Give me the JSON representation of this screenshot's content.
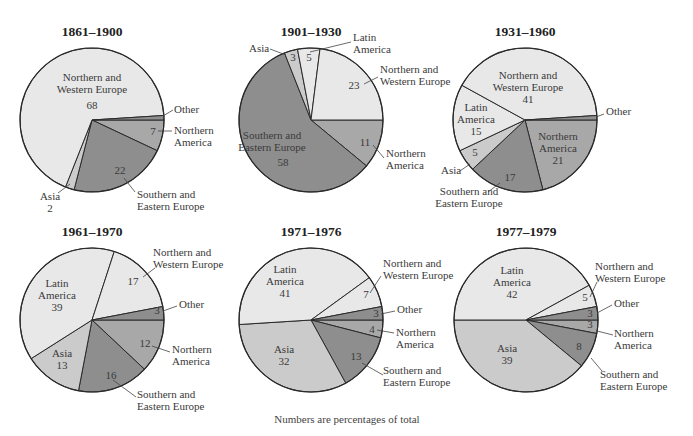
{
  "caption": "Numbers are percentages of total",
  "colors": {
    "Northern and Western Europe": "#e8e8e8",
    "Latin America": "#e8e8e8",
    "Asia": "#cbcbcb",
    "Northern America": "#a8a8a8",
    "Southern and Eastern Europe": "#8e8e8e",
    "Other": "#8e8e8e"
  },
  "chart_data": [
    {
      "type": "pie",
      "title": "1861–1900",
      "center": [
        92,
        120
      ],
      "radius": 72,
      "start_angle_deg": 0,
      "direction": "clockwise",
      "slices": [
        {
          "label": "Northern America",
          "value": 7
        },
        {
          "label": "Southern and Eastern Europe",
          "value": 22
        },
        {
          "label": "Asia",
          "value": 2
        },
        {
          "label": "Northern and Western Europe",
          "value": 68
        },
        {
          "label": "Other",
          "value": 1
        }
      ],
      "annotations": [
        {
          "lines": [
            "Northern and",
            "Western Europe"
          ],
          "x": 92,
          "y": 81,
          "anchor": "middle"
        },
        {
          "lines": [
            "68"
          ],
          "x": 92,
          "y": 109,
          "anchor": "middle"
        },
        {
          "lines": [
            "Other"
          ],
          "x": 174,
          "y": 113,
          "anchor": "start",
          "leader": [
            [
              173,
              110
            ],
            [
              163,
              116
            ]
          ]
        },
        {
          "lines": [
            "Northern",
            "America"
          ],
          "x": 174,
          "y": 134,
          "anchor": "start",
          "leader": [
            [
              172,
              131
            ],
            [
              158,
              131
            ]
          ]
        },
        {
          "lines": [
            "7"
          ],
          "x": 153,
          "y": 135,
          "anchor": "middle"
        },
        {
          "lines": [
            "22"
          ],
          "x": 120,
          "y": 174,
          "anchor": "middle"
        },
        {
          "lines": [
            "Southern and",
            "Eastern Europe"
          ],
          "x": 137,
          "y": 198,
          "anchor": "start",
          "leader": [
            [
              135,
              192
            ],
            [
              124,
              178
            ]
          ]
        },
        {
          "lines": [
            "Asia",
            "2"
          ],
          "x": 50,
          "y": 200,
          "anchor": "middle",
          "leader": [
            [
              58,
              193
            ],
            [
              70,
              184
            ]
          ]
        }
      ]
    },
    {
      "type": "pie",
      "title": "1901–1930",
      "center": [
        311,
        120
      ],
      "radius": 72,
      "start_angle_deg": 0,
      "direction": "clockwise",
      "slices": [
        {
          "label": "Northern America",
          "value": 11
        },
        {
          "label": "Southern and Eastern Europe",
          "value": 58
        },
        {
          "label": "Asia",
          "value": 3
        },
        {
          "label": "Latin America",
          "value": 5
        },
        {
          "label": "Northern and Western Europe",
          "value": 23
        }
      ],
      "annotations": [
        {
          "lines": [
            "Latin",
            "America"
          ],
          "x": 353,
          "y": 41,
          "anchor": "start",
          "leader": [
            [
              351,
              42
            ],
            [
              310,
              52
            ]
          ]
        },
        {
          "lines": [
            "Asia"
          ],
          "x": 249,
          "y": 52,
          "anchor": "start",
          "leader": [
            [
              270,
              49
            ],
            [
              286,
              55
            ]
          ]
        },
        {
          "lines": [
            "3"
          ],
          "x": 293,
          "y": 61,
          "anchor": "middle"
        },
        {
          "lines": [
            "5"
          ],
          "x": 309,
          "y": 61,
          "anchor": "middle"
        },
        {
          "lines": [
            "Northern and",
            "Western Europe"
          ],
          "x": 380,
          "y": 73,
          "anchor": "start",
          "leader": [
            [
              378,
              77
            ],
            [
              364,
              84
            ]
          ]
        },
        {
          "lines": [
            "23"
          ],
          "x": 354,
          "y": 89,
          "anchor": "middle"
        },
        {
          "lines": [
            "Southern and",
            "Eastern Europe"
          ],
          "x": 272,
          "y": 139,
          "anchor": "middle"
        },
        {
          "lines": [
            "58"
          ],
          "x": 283,
          "y": 166,
          "anchor": "middle"
        },
        {
          "lines": [
            "11"
          ],
          "x": 365,
          "y": 146,
          "anchor": "middle",
          "leader": [
            [
              373,
              145
            ],
            [
              384,
              158
            ]
          ]
        },
        {
          "lines": [
            "Northern",
            "America"
          ],
          "x": 386,
          "y": 157,
          "anchor": "start"
        }
      ]
    },
    {
      "type": "pie",
      "title": "1931–1960",
      "center": [
        525,
        120
      ],
      "radius": 72,
      "start_angle_deg": 0,
      "direction": "clockwise",
      "slices": [
        {
          "label": "Northern America",
          "value": 21
        },
        {
          "label": "Southern and Eastern Europe",
          "value": 17
        },
        {
          "label": "Asia",
          "value": 5
        },
        {
          "label": "Latin America",
          "value": 15
        },
        {
          "label": "Northern and Western Europe",
          "value": 41
        },
        {
          "label": "Other",
          "value": 1
        }
      ],
      "annotations": [
        {
          "lines": [
            "Northern and",
            "Western Europe",
            "41"
          ],
          "x": 528,
          "y": 79,
          "anchor": "middle"
        },
        {
          "lines": [
            "Latin",
            "America",
            "15"
          ],
          "x": 476,
          "y": 111,
          "anchor": "middle"
        },
        {
          "lines": [
            "Other"
          ],
          "x": 606,
          "y": 115,
          "anchor": "start",
          "leader": [
            [
              604,
              114
            ],
            [
              596,
              117
            ]
          ]
        },
        {
          "lines": [
            "Northern",
            "America",
            "21"
          ],
          "x": 558,
          "y": 140,
          "anchor": "middle"
        },
        {
          "lines": [
            "5"
          ],
          "x": 475,
          "y": 156,
          "anchor": "middle"
        },
        {
          "lines": [
            "Asia"
          ],
          "x": 441,
          "y": 174,
          "anchor": "start",
          "leader": [
            [
              460,
              171
            ],
            [
              470,
              164
            ]
          ]
        },
        {
          "lines": [
            "17"
          ],
          "x": 510,
          "y": 181,
          "anchor": "middle"
        },
        {
          "lines": [
            "Southern and",
            "Eastern Europe"
          ],
          "x": 469,
          "y": 195,
          "anchor": "middle",
          "leader": [
            [
              488,
              192
            ],
            [
              500,
              183
            ]
          ]
        }
      ]
    },
    {
      "type": "pie",
      "title": "1961–1970",
      "center": [
        92,
        320
      ],
      "radius": 72,
      "start_angle_deg": 0,
      "direction": "clockwise",
      "slices": [
        {
          "label": "Northern America",
          "value": 12
        },
        {
          "label": "Southern and Eastern Europe",
          "value": 16
        },
        {
          "label": "Asia",
          "value": 13
        },
        {
          "label": "Latin America",
          "value": 39
        },
        {
          "label": "Northern and Western Europe",
          "value": 17
        },
        {
          "label": "Other",
          "value": 3
        }
      ],
      "annotations": [
        {
          "lines": [
            "Northern and",
            "Western Europe"
          ],
          "x": 153,
          "y": 256,
          "anchor": "start",
          "leader": [
            [
              155,
              268
            ],
            [
              143,
              277
            ]
          ]
        },
        {
          "lines": [
            "17"
          ],
          "x": 133,
          "y": 285,
          "anchor": "middle"
        },
        {
          "lines": [
            "Latin",
            "America",
            "39"
          ],
          "x": 57,
          "y": 287,
          "anchor": "middle"
        },
        {
          "lines": [
            "Other"
          ],
          "x": 179,
          "y": 308,
          "anchor": "start",
          "leader": [
            [
              177,
              306
            ],
            [
              163,
              311
            ]
          ]
        },
        {
          "lines": [
            "3"
          ],
          "x": 157,
          "y": 314,
          "anchor": "middle"
        },
        {
          "lines": [
            "12"
          ],
          "x": 145,
          "y": 347,
          "anchor": "middle",
          "leader": [
            [
              152,
              346
            ],
            [
              170,
              352
            ]
          ]
        },
        {
          "lines": [
            "Northern",
            "America"
          ],
          "x": 172,
          "y": 353,
          "anchor": "start"
        },
        {
          "lines": [
            "Asia",
            "13"
          ],
          "x": 62,
          "y": 357,
          "anchor": "middle"
        },
        {
          "lines": [
            "16"
          ],
          "x": 111,
          "y": 379,
          "anchor": "middle",
          "leader": [
            [
              113,
              380
            ],
            [
              136,
              397
            ]
          ]
        },
        {
          "lines": [
            "Southern and",
            "Eastern Europe"
          ],
          "x": 137,
          "y": 398,
          "anchor": "start"
        }
      ]
    },
    {
      "type": "pie",
      "title": "1971–1976",
      "center": [
        311,
        320
      ],
      "radius": 72,
      "start_angle_deg": 0,
      "direction": "clockwise",
      "slices": [
        {
          "label": "Northern America",
          "value": 4
        },
        {
          "label": "Southern and Eastern Europe",
          "value": 13
        },
        {
          "label": "Asia",
          "value": 32
        },
        {
          "label": "Latin America",
          "value": 41
        },
        {
          "label": "Northern and Western Europe",
          "value": 7
        },
        {
          "label": "Other",
          "value": 3
        }
      ],
      "annotations": [
        {
          "lines": [
            "Latin",
            "America",
            "41"
          ],
          "x": 285,
          "y": 273,
          "anchor": "middle"
        },
        {
          "lines": [
            "Northern and",
            "Western Europe"
          ],
          "x": 383,
          "y": 267,
          "anchor": "start",
          "leader": [
            [
              381,
              276
            ],
            [
              370,
              293
            ]
          ]
        },
        {
          "lines": [
            "7"
          ],
          "x": 366,
          "y": 298,
          "anchor": "middle"
        },
        {
          "lines": [
            "Other"
          ],
          "x": 397,
          "y": 313,
          "anchor": "start",
          "leader": [
            [
              395,
              311
            ],
            [
              381,
              314
            ]
          ]
        },
        {
          "lines": [
            "3"
          ],
          "x": 376,
          "y": 317,
          "anchor": "middle"
        },
        {
          "lines": [
            "4"
          ],
          "x": 372,
          "y": 333,
          "anchor": "middle",
          "leader": [
            [
              377,
              330
            ],
            [
              394,
              333
            ]
          ]
        },
        {
          "lines": [
            "Northern",
            "America"
          ],
          "x": 396,
          "y": 336,
          "anchor": "start"
        },
        {
          "lines": [
            "Asia",
            "32"
          ],
          "x": 284,
          "y": 353,
          "anchor": "middle"
        },
        {
          "lines": [
            "13"
          ],
          "x": 356,
          "y": 360,
          "anchor": "middle",
          "leader": [
            [
              362,
              363
            ],
            [
              383,
              375
            ]
          ]
        },
        {
          "lines": [
            "Southern and",
            "Eastern Europe"
          ],
          "x": 383,
          "y": 374,
          "anchor": "start"
        }
      ]
    },
    {
      "type": "pie",
      "title": "1977–1979",
      "center": [
        526,
        320
      ],
      "radius": 72,
      "start_angle_deg": 0,
      "direction": "clockwise",
      "slices": [
        {
          "label": "Northern America",
          "value": 3
        },
        {
          "label": "Southern and Eastern Europe",
          "value": 8
        },
        {
          "label": "Asia",
          "value": 39
        },
        {
          "label": "Latin America",
          "value": 42
        },
        {
          "label": "Northern and Western Europe",
          "value": 5
        },
        {
          "label": "Other",
          "value": 3
        }
      ],
      "annotations": [
        {
          "lines": [
            "Latin",
            "America",
            "42"
          ],
          "x": 512,
          "y": 274,
          "anchor": "middle"
        },
        {
          "lines": [
            "Northern and",
            "Western Europe"
          ],
          "x": 595,
          "y": 270,
          "anchor": "start",
          "leader": [
            [
              597,
              282
            ],
            [
              590,
              297
            ]
          ]
        },
        {
          "lines": [
            "5"
          ],
          "x": 585,
          "y": 301,
          "anchor": "middle"
        },
        {
          "lines": [
            "Other"
          ],
          "x": 614,
          "y": 307,
          "anchor": "start",
          "leader": [
            [
              612,
              305
            ],
            [
              597,
              313
            ]
          ]
        },
        {
          "lines": [
            "3"
          ],
          "x": 590,
          "y": 317,
          "anchor": "middle"
        },
        {
          "lines": [
            "3"
          ],
          "x": 590,
          "y": 328,
          "anchor": "middle",
          "leader": [
            [
              597,
              331
            ],
            [
              613,
              335
            ]
          ]
        },
        {
          "lines": [
            "Northern",
            "America"
          ],
          "x": 614,
          "y": 337,
          "anchor": "start"
        },
        {
          "lines": [
            "Asia",
            "39"
          ],
          "x": 507,
          "y": 352,
          "anchor": "middle"
        },
        {
          "lines": [
            "8"
          ],
          "x": 579,
          "y": 350,
          "anchor": "middle",
          "leader": [
            [
              591,
              358
            ],
            [
              602,
              371
            ]
          ]
        },
        {
          "lines": [
            "Southern and",
            "Eastern Europe"
          ],
          "x": 600,
          "y": 378,
          "anchor": "start"
        }
      ]
    }
  ]
}
